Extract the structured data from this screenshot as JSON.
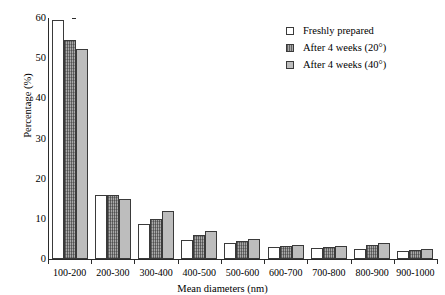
{
  "chart_data": {
    "type": "bar",
    "title": "",
    "xlabel": "Mean diameters (nm)",
    "ylabel": "Percentage (%)",
    "ylim": [
      0,
      60
    ],
    "yticks": [
      0,
      10,
      20,
      30,
      40,
      50,
      60
    ],
    "grid": false,
    "legend_position": "top-right",
    "categories": [
      "100-200",
      "200-300",
      "300-400",
      "400-500",
      "500-600",
      "600-700",
      "700-800",
      "800-900",
      "900-1000"
    ],
    "series": [
      {
        "name": "Freshly prepared",
        "swatch": "s0",
        "values": [
          59.5,
          16.0,
          8.7,
          4.8,
          4.0,
          3.0,
          2.8,
          2.5,
          2.0
        ]
      },
      {
        "name": "After 4 weeks (20°)",
        "swatch": "s1",
        "values": [
          54.5,
          16.0,
          10.0,
          6.0,
          4.5,
          3.3,
          3.1,
          3.5,
          2.2
        ]
      },
      {
        "name": "After 4 weeks (40°)",
        "swatch": "s2",
        "values": [
          52.3,
          15.0,
          12.0,
          7.0,
          5.0,
          3.4,
          3.2,
          4.0,
          2.5
        ]
      }
    ]
  },
  "legend": {
    "items": [
      {
        "label": "Freshly prepared"
      },
      {
        "label": "After 4 weeks (20°)"
      },
      {
        "label": "After 4 weeks (40°)"
      }
    ]
  }
}
